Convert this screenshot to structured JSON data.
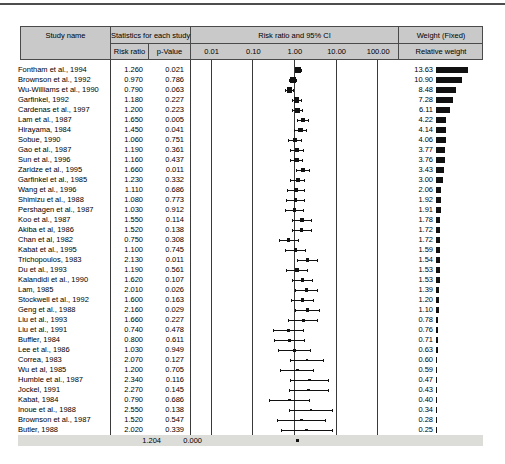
{
  "colors": {
    "header_bg": "#c9c9c9",
    "summary_bg": "#dcdcd8",
    "rule": "#3a3a3a",
    "ink": "#111111"
  },
  "header": {
    "study_name": "Study name",
    "stats_group": "Statistics for each study",
    "risk_ratio": "Risk ratio",
    "p_value": "p-Value",
    "plot_group": "Risk ratio and 95% CI",
    "weight_group": "Weight (Fixed)",
    "weight_sub": "Relative weight"
  },
  "axis": {
    "scale": "log",
    "ticks": [
      "0.01",
      "0.10",
      "1.00",
      "10.00",
      "100.00"
    ],
    "tick_values": [
      0.01,
      0.1,
      1,
      10,
      100
    ]
  },
  "chart_data": {
    "type": "scatter",
    "subtype": "forest-plot",
    "title": "",
    "xlabel": "Risk ratio and 95% CI",
    "x_scale": "log",
    "x_ticks": [
      0.01,
      0.1,
      1,
      10,
      100
    ],
    "studies": [
      {
        "name": "Fontham et al., 1994",
        "risk_ratio": "1.260",
        "p_value": "0.021",
        "weight": "13.63"
      },
      {
        "name": "Brownson et al., 1992",
        "risk_ratio": "0.970",
        "p_value": "0.786",
        "weight": "10.90"
      },
      {
        "name": "Wu-Williams et al., 1990",
        "risk_ratio": "0.790",
        "p_value": "0.063",
        "weight": "8.48"
      },
      {
        "name": "Garfinkel, 1992",
        "risk_ratio": "1.180",
        "p_value": "0.227",
        "weight": "7.28"
      },
      {
        "name": "Cardenas et al., 1997",
        "risk_ratio": "1.200",
        "p_value": "0.223",
        "weight": "6.11"
      },
      {
        "name": "Lam et al., 1987",
        "risk_ratio": "1.650",
        "p_value": "0.005",
        "weight": "4.22"
      },
      {
        "name": "Hirayama, 1984",
        "risk_ratio": "1.450",
        "p_value": "0.041",
        "weight": "4.14"
      },
      {
        "name": "Sobue, 1990",
        "risk_ratio": "1.060",
        "p_value": "0.751",
        "weight": "4.06"
      },
      {
        "name": "Gao et al., 1987",
        "risk_ratio": "1.190",
        "p_value": "0.361",
        "weight": "3.77"
      },
      {
        "name": "Sun et al., 1996",
        "risk_ratio": "1.160",
        "p_value": "0.437",
        "weight": "3.76"
      },
      {
        "name": "Zaridze et al., 1995",
        "risk_ratio": "1.660",
        "p_value": "0.011",
        "weight": "3.43"
      },
      {
        "name": "Garfinkel et al., 1985",
        "risk_ratio": "1.230",
        "p_value": "0.332",
        "weight": "3.00"
      },
      {
        "name": "Wang et al., 1996",
        "risk_ratio": "1.110",
        "p_value": "0.686",
        "weight": "2.06"
      },
      {
        "name": "Shimizu et al., 1988",
        "risk_ratio": "1.080",
        "p_value": "0.773",
        "weight": "1.92"
      },
      {
        "name": "Pershagen et al., 1987",
        "risk_ratio": "1.030",
        "p_value": "0.912",
        "weight": "1.91"
      },
      {
        "name": "Koo et al., 1987",
        "risk_ratio": "1.550",
        "p_value": "0.114",
        "weight": "1.78"
      },
      {
        "name": "Akiba et al, 1986",
        "risk_ratio": "1.520",
        "p_value": "0.138",
        "weight": "1.72"
      },
      {
        "name": "Chan et al, 1982",
        "risk_ratio": "0.750",
        "p_value": "0.308",
        "weight": "1.72"
      },
      {
        "name": "Kabat et al., 1995",
        "risk_ratio": "1.100",
        "p_value": "0.745",
        "weight": "1.59"
      },
      {
        "name": "Trichopoulos, 1983",
        "risk_ratio": "2.130",
        "p_value": "0.011",
        "weight": "1.54"
      },
      {
        "name": "Du et al., 1993",
        "risk_ratio": "1.190",
        "p_value": "0.561",
        "weight": "1.53"
      },
      {
        "name": "Kalandidi et al., 1990",
        "risk_ratio": "1.620",
        "p_value": "0.107",
        "weight": "1.53"
      },
      {
        "name": "Lam, 1985",
        "risk_ratio": "2.010",
        "p_value": "0.026",
        "weight": "1.39"
      },
      {
        "name": "Stockwell et al., 1992",
        "risk_ratio": "1.600",
        "p_value": "0.163",
        "weight": "1.20"
      },
      {
        "name": "Geng et al., 1988",
        "risk_ratio": "2.160",
        "p_value": "0.029",
        "weight": "1.10"
      },
      {
        "name": "Liu et al., 1993",
        "risk_ratio": "1.660",
        "p_value": "0.227",
        "weight": "0.78"
      },
      {
        "name": "Liu et al., 1991",
        "risk_ratio": "0.740",
        "p_value": "0.478",
        "weight": "0.76"
      },
      {
        "name": "Buffler, 1984",
        "risk_ratio": "0.800",
        "p_value": "0.611",
        "weight": "0.71"
      },
      {
        "name": "Lee et al., 1986",
        "risk_ratio": "1.030",
        "p_value": "0.949",
        "weight": "0.63"
      },
      {
        "name": "Correa, 1983",
        "risk_ratio": "2.070",
        "p_value": "0.127",
        "weight": "0.60"
      },
      {
        "name": "Wu et al, 1985",
        "risk_ratio": "1.200",
        "p_value": "0.705",
        "weight": "0.59"
      },
      {
        "name": "Humble et al., 1987",
        "risk_ratio": "2.340",
        "p_value": "0.116",
        "weight": "0.47"
      },
      {
        "name": "Jockel, 1991",
        "risk_ratio": "2.270",
        "p_value": "0.145",
        "weight": "0.43"
      },
      {
        "name": "Kabat, 1984",
        "risk_ratio": "0.790",
        "p_value": "0.686",
        "weight": "0.40"
      },
      {
        "name": "Inoue et al., 1988",
        "risk_ratio": "2.550",
        "p_value": "0.138",
        "weight": "0.34"
      },
      {
        "name": "Brownson et al., 1987",
        "risk_ratio": "1.520",
        "p_value": "0.547",
        "weight": "0.28"
      },
      {
        "name": "Butler, 1988",
        "risk_ratio": "2.020",
        "p_value": "0.339",
        "weight": "0.25"
      }
    ],
    "summary": {
      "risk_ratio": "1.204",
      "p_value": "0.000"
    }
  }
}
